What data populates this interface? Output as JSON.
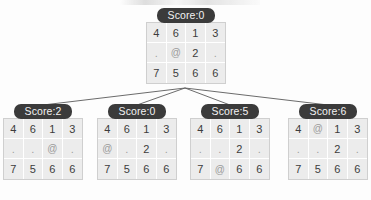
{
  "diagram": {
    "label_prefix": "Score:",
    "symbols": {
      "agent": "@",
      "empty": "."
    },
    "colors": {
      "label_background": "#3b3b3b",
      "label_text": "#f2f2f2",
      "cell_background": "#ececec",
      "digit_text": "#3c3c3c",
      "symbol_text": "#9b9b9b",
      "edge_line": "#5a5a5a"
    },
    "root": {
      "id": "root",
      "label": "Score:0",
      "score": 0,
      "grid": [
        [
          "4",
          "6",
          "1",
          "3"
        ],
        [
          ".",
          "@",
          "2",
          "."
        ],
        [
          "7",
          "5",
          "6",
          "6"
        ]
      ]
    },
    "children": [
      {
        "id": "child-1",
        "label": "Score:2",
        "score": 2,
        "grid": [
          [
            "4",
            "6",
            "1",
            "3"
          ],
          [
            ".",
            ".",
            "@",
            "."
          ],
          [
            "7",
            "5",
            "6",
            "6"
          ]
        ]
      },
      {
        "id": "child-2",
        "label": "Score:0",
        "score": 0,
        "grid": [
          [
            "4",
            "6",
            "1",
            "3"
          ],
          [
            "@",
            ".",
            "2",
            "."
          ],
          [
            "7",
            "5",
            "6",
            "6"
          ]
        ]
      },
      {
        "id": "child-3",
        "label": "Score:5",
        "score": 5,
        "grid": [
          [
            "4",
            "6",
            "1",
            "3"
          ],
          [
            ".",
            ".",
            "2",
            "."
          ],
          [
            "7",
            "@",
            "6",
            "6"
          ]
        ]
      },
      {
        "id": "child-4",
        "label": "Score:6",
        "score": 6,
        "grid": [
          [
            "4",
            "@",
            "1",
            "3"
          ],
          [
            ".",
            ".",
            "2",
            "."
          ],
          [
            "7",
            "5",
            "6",
            "6"
          ]
        ]
      }
    ],
    "edges": [
      {
        "from": "root",
        "to": "child-1"
      },
      {
        "from": "root",
        "to": "child-2"
      },
      {
        "from": "root",
        "to": "child-3"
      },
      {
        "from": "root",
        "to": "child-4"
      }
    ]
  },
  "layout": {
    "root_x": 146,
    "root_y": 8,
    "child_y": 104,
    "child_x": [
      3,
      97,
      190,
      288
    ],
    "cell_size": 20,
    "edge_apex": {
      "x": 185,
      "y": 88
    }
  }
}
